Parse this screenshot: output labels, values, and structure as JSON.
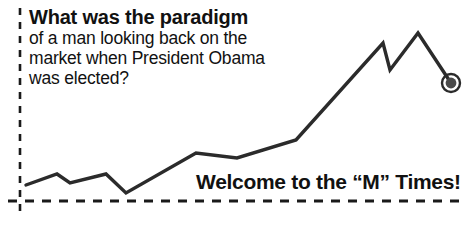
{
  "cartoon": {
    "headline": "What was the paradigm",
    "body_lines": [
      "of a man looking back on the",
      "market when President Obama",
      "was elected?"
    ],
    "tagline": "Welcome to the “M” Times!"
  },
  "colors": {
    "ink": "#111111",
    "line": "#2b2b2b",
    "axis": "#1a1a1a",
    "marker_fill": "#4a4a4a",
    "marker_ring": "#ffffff",
    "marker_outline": "#2b2b2b",
    "background": "#ffffff"
  },
  "chart_data": {
    "type": "line",
    "title": "",
    "xlabel": "",
    "ylabel": "",
    "grid": false,
    "legend": null,
    "axis_style": "dashed",
    "xlim": [
      20,
      465
    ],
    "ylim": [
      201,
      30
    ],
    "points": [
      {
        "x": 26,
        "y": 185
      },
      {
        "x": 57,
        "y": 174
      },
      {
        "x": 70,
        "y": 183
      },
      {
        "x": 106,
        "y": 174
      },
      {
        "x": 126,
        "y": 193
      },
      {
        "x": 196,
        "y": 153
      },
      {
        "x": 237,
        "y": 158
      },
      {
        "x": 296,
        "y": 140
      },
      {
        "x": 383,
        "y": 43
      },
      {
        "x": 390,
        "y": 70
      },
      {
        "x": 418,
        "y": 33
      },
      {
        "x": 451,
        "y": 83
      }
    ],
    "marker": {
      "x": 451,
      "y": 83,
      "radius": 9,
      "shape": "donut"
    },
    "axes": {
      "vertical": {
        "x": 20,
        "y_top": 8,
        "y_bottom": 218
      },
      "horizontal": {
        "y": 201,
        "x_left": 8,
        "x_right": 465
      }
    },
    "annotation": "Stock market line rising from left to a late peak then falling to a highlighted endpoint"
  }
}
